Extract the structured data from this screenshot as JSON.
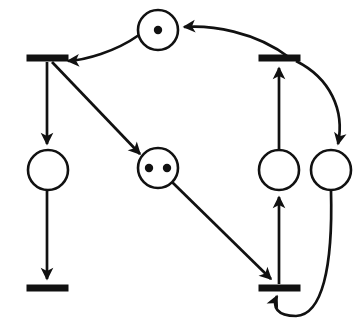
{
  "diagram": {
    "type": "petri-net",
    "width": 363,
    "height": 324,
    "background_color": "#ffffff",
    "stroke_color": "#111111",
    "token_color": "#111111",
    "place_fill": "#ffffff"
  },
  "places": [
    {
      "id": "p1",
      "label": "",
      "cx": 158,
      "cy": 30,
      "r": 20,
      "tokens": 1,
      "token_positions": [
        [
          158,
          30
        ]
      ]
    },
    {
      "id": "p2",
      "label": "",
      "cx": 48,
      "cy": 170,
      "r": 20,
      "tokens": 0,
      "token_positions": []
    },
    {
      "id": "p3",
      "label": "",
      "cx": 158,
      "cy": 168,
      "r": 20,
      "tokens": 2,
      "token_positions": [
        [
          149,
          168
        ],
        [
          167,
          168
        ]
      ]
    },
    {
      "id": "p4",
      "label": "",
      "cx": 279,
      "cy": 170,
      "r": 20,
      "tokens": 0,
      "token_positions": []
    },
    {
      "id": "p5",
      "label": "",
      "cx": 331,
      "cy": 170,
      "r": 20,
      "tokens": 0,
      "token_positions": []
    }
  ],
  "transitions": [
    {
      "id": "t1",
      "label": "",
      "x": 27,
      "y": 55,
      "width": 41,
      "height": 6
    },
    {
      "id": "t2",
      "label": "",
      "x": 259,
      "y": 55,
      "width": 41,
      "height": 6
    },
    {
      "id": "t3",
      "label": "",
      "x": 27,
      "y": 285,
      "width": 41,
      "height": 6
    },
    {
      "id": "t4",
      "label": "",
      "x": 259,
      "y": 285,
      "width": 41,
      "height": 6
    }
  ],
  "arcs": [
    {
      "id": "a1",
      "from": "p1",
      "to": "t1",
      "shape": "curve",
      "path": "M 139 35 C 115 52, 85 60, 68 61"
    },
    {
      "id": "a2",
      "from": "t1",
      "to": "p2",
      "shape": "line",
      "path": "M 47 62 L 47 144"
    },
    {
      "id": "a3",
      "from": "t1",
      "to": "p3",
      "shape": "line",
      "path": "M 52 62 L 140 154"
    },
    {
      "id": "a4",
      "from": "p2",
      "to": "t3",
      "shape": "line",
      "path": "M 47 191 L 47 279"
    },
    {
      "id": "a5",
      "from": "p3",
      "to": "t4",
      "shape": "line",
      "path": "M 172 182 L 271 279"
    },
    {
      "id": "a6",
      "from": "t4",
      "to": "p4",
      "shape": "line",
      "path": "M 279 284 L 279 197"
    },
    {
      "id": "a7",
      "from": "p4",
      "to": "t2",
      "shape": "line",
      "path": "M 279 149 L 279 68"
    },
    {
      "id": "a8",
      "from": "t2",
      "to": "p1",
      "shape": "curve",
      "path": "M 290 58 C 255 31, 210 25, 184 27"
    },
    {
      "id": "a9",
      "from": "t2",
      "to": "p5",
      "shape": "curve",
      "path": "M 296 61 C 330 78, 345 110, 338 144"
    },
    {
      "id": "a10",
      "from": "p5",
      "to": "t4",
      "shape": "curve",
      "path": "M 331 191 C 333 268, 322 315, 296 316 C 277 316, 272 307, 277 296"
    }
  ],
  "legend": {
    "place_meaning": "place",
    "transition_meaning": "transition",
    "token_meaning": "token"
  }
}
